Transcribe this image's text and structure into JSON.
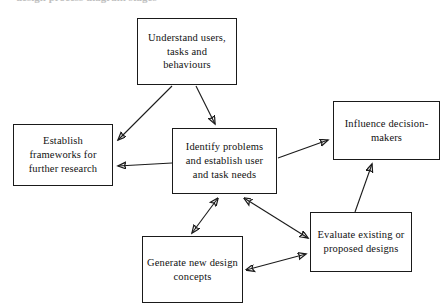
{
  "page": {
    "heading_partial": "design process diagram stages",
    "background_color": "#ffffff",
    "line_color": "#1a1a1a",
    "text_color": "#111111",
    "width": 447,
    "height": 308
  },
  "diagram": {
    "type": "flowchart",
    "nodes": [
      {
        "id": "understand",
        "label": "Understand users, tasks and behaviours",
        "x": 137,
        "y": 18,
        "w": 100,
        "h": 67
      },
      {
        "id": "establish",
        "label": "Establish frameworks for further research",
        "x": 13,
        "y": 124,
        "w": 100,
        "h": 62
      },
      {
        "id": "identify",
        "label": "Identify problems and establish user and task needs",
        "x": 172,
        "y": 128,
        "w": 105,
        "h": 66
      },
      {
        "id": "influence",
        "label": "Influence decision-makers",
        "x": 333,
        "y": 101,
        "w": 107,
        "h": 59
      },
      {
        "id": "evaluate",
        "label": "Evaluate existing or proposed designs",
        "x": 310,
        "y": 212,
        "w": 102,
        "h": 60
      },
      {
        "id": "generate",
        "label": "Generate new design concepts",
        "x": 142,
        "y": 236,
        "w": 101,
        "h": 67
      }
    ],
    "edges": [
      {
        "id": "understand-to-establish",
        "from": "understand",
        "to": "establish",
        "arrows": "single"
      },
      {
        "id": "understand-to-identify",
        "from": "understand",
        "to": "identify",
        "arrows": "single"
      },
      {
        "id": "identify-to-establish",
        "from": "identify",
        "to": "establish",
        "arrows": "single"
      },
      {
        "id": "identify-to-influence",
        "from": "identify",
        "to": "influence",
        "arrows": "single"
      },
      {
        "id": "identify-generate",
        "from": "identify",
        "to": "generate",
        "arrows": "double"
      },
      {
        "id": "identify-evaluate",
        "from": "identify",
        "to": "evaluate",
        "arrows": "double"
      },
      {
        "id": "generate-evaluate",
        "from": "generate",
        "to": "evaluate",
        "arrows": "double"
      },
      {
        "id": "evaluate-to-influence",
        "from": "evaluate",
        "to": "influence",
        "arrows": "single"
      }
    ]
  }
}
